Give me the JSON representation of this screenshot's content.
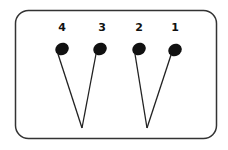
{
  "diagram": {
    "frame": {
      "x": 15,
      "y": 10,
      "width": 201,
      "height": 129,
      "radius": 13,
      "stroke": "#333333"
    },
    "colors": {
      "note_fill": "#111111",
      "line": "#222222"
    },
    "notes": [
      {
        "label": "4",
        "label_x": 62,
        "label_y": 31,
        "cx": 62,
        "cy": 49
      },
      {
        "label": "3",
        "label_x": 102,
        "label_y": 31,
        "cx": 100,
        "cy": 49
      },
      {
        "label": "2",
        "label_x": 139,
        "label_y": 31,
        "cx": 139,
        "cy": 49
      },
      {
        "label": "1",
        "label_x": 175,
        "label_y": 31,
        "cx": 175,
        "cy": 50
      }
    ],
    "vertices": [
      {
        "x": 82,
        "y": 128
      },
      {
        "x": 147,
        "y": 128
      }
    ]
  }
}
